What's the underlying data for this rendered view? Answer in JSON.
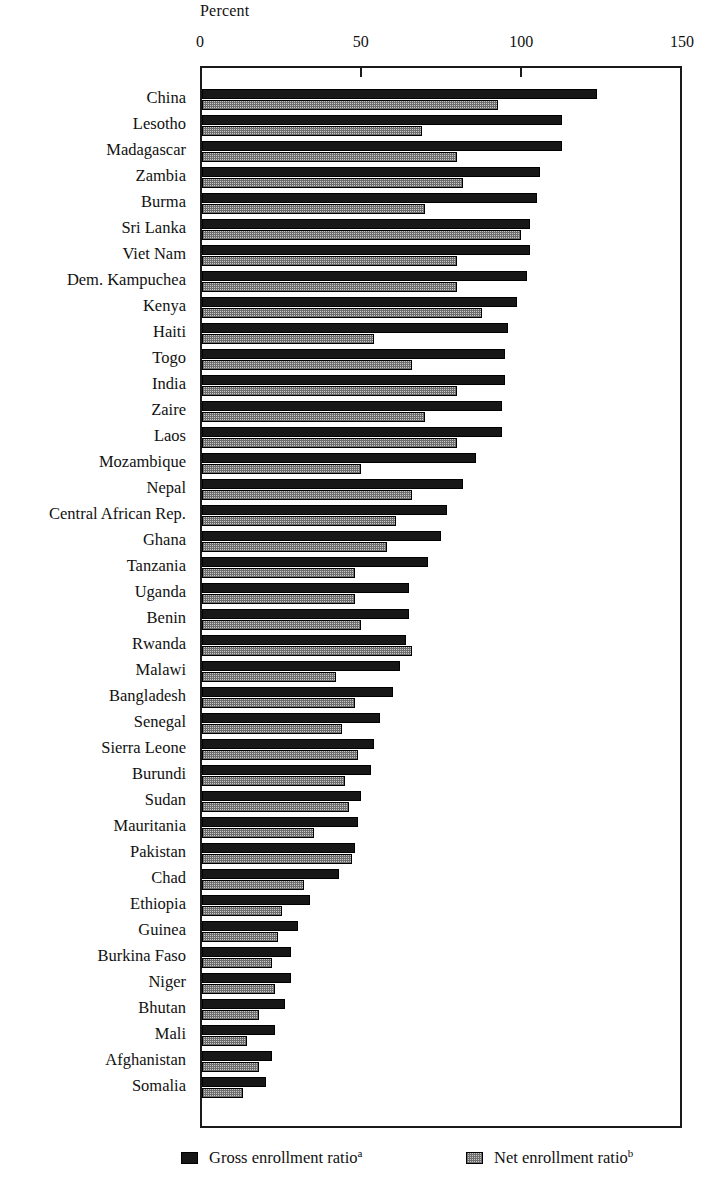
{
  "chart_data": {
    "type": "bar",
    "orientation": "horizontal",
    "title": "",
    "xlabel": "Percent",
    "ylabel": "",
    "xlim": [
      0,
      150
    ],
    "xticks": [
      0,
      50,
      100,
      150
    ],
    "xtick_labels": [
      "0",
      "50",
      "100",
      "150"
    ],
    "grid": false,
    "legend_position": "bottom",
    "series": [
      {
        "name": "Gross enrollment ratio",
        "footnote": "a",
        "color": "#171717",
        "values": [
          124,
          113,
          113,
          106,
          105,
          103,
          103,
          102,
          99,
          96,
          95,
          95,
          94,
          94,
          86,
          82,
          77,
          75,
          71,
          65,
          65,
          64,
          62,
          60,
          56,
          54,
          53,
          50,
          49,
          48,
          43,
          34,
          30,
          28,
          28,
          26,
          23,
          22,
          20
        ]
      },
      {
        "name": "Net enrollment ratio",
        "footnote": "b",
        "color": "#c9c9c9",
        "values": [
          93,
          69,
          80,
          82,
          70,
          100,
          80,
          80,
          88,
          54,
          66,
          80,
          70,
          80,
          50,
          66,
          61,
          58,
          48,
          48,
          50,
          66,
          42,
          48,
          44,
          49,
          45,
          46,
          35,
          47,
          32,
          25,
          24,
          22,
          23,
          18,
          14,
          18,
          13
        ]
      }
    ],
    "categories": [
      "China",
      "Lesotho",
      "Madagascar",
      "Zambia",
      "Burma",
      "Sri Lanka",
      "Viet Nam",
      "Dem. Kampuchea",
      "Kenya",
      "Haiti",
      "Togo",
      "India",
      "Zaire",
      "Laos",
      "Mozambique",
      "Nepal",
      "Central African Rep.",
      "Ghana",
      "Tanzania",
      "Uganda",
      "Benin",
      "Rwanda",
      "Malawi",
      "Bangladesh",
      "Senegal",
      "Sierra Leone",
      "Burundi",
      "Sudan",
      "Mauritania",
      "Pakistan",
      "Chad",
      "Ethiopia",
      "Guinea",
      "Burkina Faso",
      "Niger",
      "Bhutan",
      "Mali",
      "Afghanistan",
      "Somalia"
    ]
  },
  "legend": {
    "items": [
      {
        "label": "Gross enrollment ratio",
        "footnote": "a",
        "swatch": "dark-solid-swatch"
      },
      {
        "label": "Net enrollment ratio",
        "footnote": "b",
        "swatch": "light-dotted-swatch"
      }
    ]
  }
}
